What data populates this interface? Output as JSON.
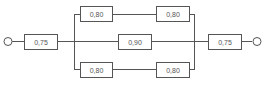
{
  "diagram": {
    "type": "reliability-block-diagram",
    "input_terminal": "input-terminal",
    "output_terminal": "output-terminal",
    "blocks": {
      "series_in": "0,75",
      "upper_1": "0,80",
      "upper_2": "0,80",
      "middle": "0,90",
      "lower_1": "0,80",
      "lower_2": "0,80",
      "series_out": "0,75"
    }
  }
}
